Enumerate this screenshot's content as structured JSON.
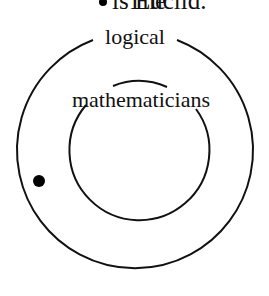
{
  "caption": {
    "before": "The",
    "after": "is Euclid."
  },
  "outer_label": "logical",
  "inner_label": "mathematicians",
  "colors": {
    "stroke": "#111111",
    "background": "#ffffff",
    "dot": "#000000"
  }
}
